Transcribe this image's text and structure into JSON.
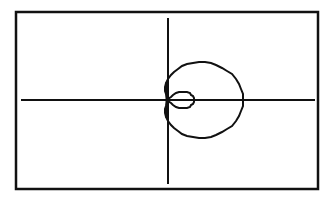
{
  "chart_data": {
    "type": "line",
    "title": "",
    "subtitle": "",
    "xlabel": "",
    "ylabel": "",
    "equation": "r = a + b*cos(theta)",
    "parameters": {
      "a": 24.5,
      "b": 50.5
    },
    "theta_range": [
      0,
      6.2832
    ],
    "grid": false,
    "legend": null,
    "axes": {
      "origin_px": [
        168,
        100
      ],
      "x_axis_px": [
        21,
        315
      ],
      "y_axis_px": [
        18,
        184
      ]
    },
    "frame_px": {
      "left": 16,
      "top": 12,
      "right": 318,
      "bottom": 189
    },
    "curve_extents_px": {
      "outer_right_x": 243,
      "inner_loop_right_x": 194,
      "top_y": 57,
      "bottom_y": 144
    },
    "series": [
      {
        "name": "limacon",
        "color": "#111111"
      }
    ]
  },
  "colors": {
    "background": "#ffffff",
    "ink": "#111111"
  }
}
